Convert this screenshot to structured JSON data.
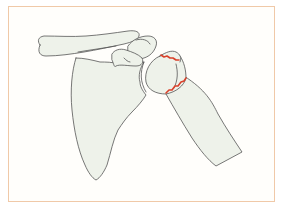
{
  "figure": {
    "side_mark": "e",
    "bones": [
      "clavicle",
      "scapula",
      "acromion",
      "coracoid process",
      "humeral head",
      "humerus shaft"
    ],
    "fracture_lines": 2,
    "colors": {
      "frame_border": "#f0c9a8",
      "bone_fill": "#eef2ea",
      "bone_outline": "#555555",
      "fracture": "#d9412b",
      "background": "#ffffff"
    }
  }
}
